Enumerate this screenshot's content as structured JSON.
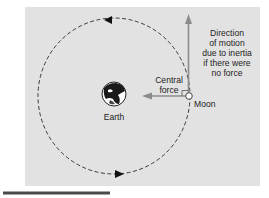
{
  "diagram": {
    "background_color": "#e2e2e2",
    "orbit_color": "#3a3a3a",
    "arrow_color": "#8c8c8c",
    "labels": {
      "earth": "Earth",
      "moon": "Moon",
      "central_force_line1": "Central",
      "central_force_line2": "force",
      "inertia_line1": "Direction",
      "inertia_line2": "of motion",
      "inertia_line3": "due to inertia",
      "inertia_line4": "if there were",
      "inertia_line5": "no force"
    },
    "nodes": [
      {
        "id": "earth",
        "label": "Earth"
      },
      {
        "id": "moon",
        "label": "Moon"
      }
    ],
    "edges": [
      {
        "from": "moon",
        "to": "earth",
        "label": "Central force"
      },
      {
        "from": "moon",
        "to": "up",
        "label": "Direction of motion due to inertia if there were no force"
      }
    ],
    "orbit_direction": "counterclockwise"
  }
}
